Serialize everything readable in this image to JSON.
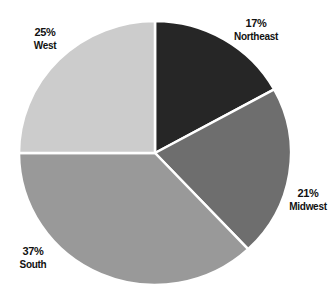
{
  "chart_data": {
    "type": "pie",
    "title": "",
    "start_angle_deg": 0,
    "direction": "clockwise",
    "categories": [
      "Northeast",
      "Midwest",
      "South",
      "West"
    ],
    "values": [
      17,
      21,
      37,
      25
    ],
    "unit": "%",
    "colors": [
      "#262626",
      "#6e6e6e",
      "#999999",
      "#cccccc"
    ],
    "legend": "none (labels placed outside slices)"
  },
  "geometry": {
    "cx": 155,
    "cy": 153,
    "rx": 136,
    "ry": 132
  },
  "labels": [
    {
      "pct": "17%",
      "name": "Northeast",
      "x": 256,
      "y": 17
    },
    {
      "pct": "21%",
      "name": "Midwest",
      "x": 308,
      "y": 187
    },
    {
      "pct": "37%",
      "name": "South",
      "x": 33,
      "y": 245
    },
    {
      "pct": "25%",
      "name": "West",
      "x": 45,
      "y": 26
    }
  ]
}
